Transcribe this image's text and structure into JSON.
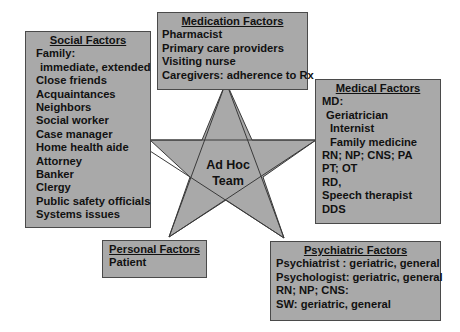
{
  "diagram": {
    "center": {
      "line1": "Ad Hoc",
      "line2": "Team"
    },
    "colors": {
      "box_fill": "#a9a9a9",
      "border": "#4a4a4a",
      "text": "#111111",
      "background": "#ffffff"
    },
    "social": {
      "title": "Social Factors",
      "items": [
        {
          "text": "Family:",
          "indent": 0
        },
        {
          "text": "immediate, extended",
          "indent": 1
        },
        {
          "text": "Close friends",
          "indent": 0
        },
        {
          "text": "Acquaintances",
          "indent": 0
        },
        {
          "text": "Neighbors",
          "indent": 0
        },
        {
          "text": "Social worker",
          "indent": 0
        },
        {
          "text": "Case manager",
          "indent": 0
        },
        {
          "text": "Home health aide",
          "indent": 0
        },
        {
          "text": "Attorney",
          "indent": 0
        },
        {
          "text": "Banker",
          "indent": 0
        },
        {
          "text": "Clergy",
          "indent": 0
        },
        {
          "text": "Public safety officials",
          "indent": 0
        },
        {
          "text": "Systems issues",
          "indent": 0
        }
      ]
    },
    "medication": {
      "title": "Medication Factors",
      "items": [
        {
          "text": "Pharmacist",
          "indent": 0
        },
        {
          "text": "Primary care providers",
          "indent": 0
        },
        {
          "text": "Visiting nurse",
          "indent": 0
        },
        {
          "text": "Caregivers: adherence to Rx",
          "indent": 0
        }
      ]
    },
    "medical": {
      "title": "Medical Factors",
      "items": [
        {
          "text": "MD:",
          "indent": 0
        },
        {
          "text": "Geriatrician",
          "indent": 1
        },
        {
          "text": "Internist",
          "indent": 2
        },
        {
          "text": "Family medicine",
          "indent": 2
        },
        {
          "text": "RN; NP; CNS; PA",
          "indent": 0
        },
        {
          "text": "PT; OT",
          "indent": 0
        },
        {
          "text": "RD,",
          "indent": 0
        },
        {
          "text": "Speech therapist",
          "indent": 0
        },
        {
          "text": "DDS",
          "indent": 0
        }
      ]
    },
    "personal": {
      "title": "Personal Factors",
      "items": [
        {
          "text": "Patient",
          "indent": 0
        }
      ]
    },
    "psychiatric": {
      "title": "Psychiatric Factors",
      "items": [
        {
          "text": "Psychiatrist : geriatric, general",
          "indent": 0
        },
        {
          "text": "Psychologist: geriatric, general",
          "indent": 0
        },
        {
          "text": "RN; NP; CNS:",
          "indent": 0
        },
        {
          "text": "SW: geriatric, general",
          "indent": 0
        }
      ]
    }
  }
}
